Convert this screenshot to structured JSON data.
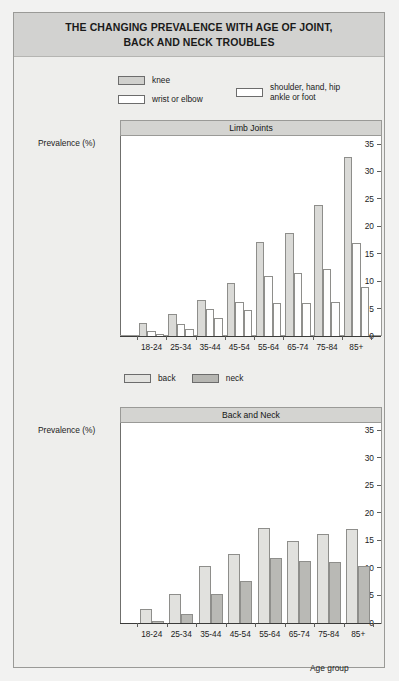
{
  "figure": {
    "title_line1": "THE CHANGING PREVALENCE WITH AGE OF JOINT,",
    "title_line2": "BACK AND NECK TROUBLES",
    "background_color": "#eeeeec",
    "title_band_color": "#d2d2d0",
    "border_color": "#9a9a97"
  },
  "legend1": {
    "items": [
      {
        "label": "knee",
        "swatch": "knee-swatch",
        "color": "#d0d0cd"
      },
      {
        "label": "wrist or elbow",
        "swatch": "wrist-or-elbow-swatch",
        "color": "#ffffff"
      },
      {
        "label_line1": "shoulder, hand, hip",
        "label_line2": "ankle or foot",
        "swatch": "shoulder-hand-hip-swatch",
        "color": "#ffffff"
      }
    ]
  },
  "legend2": {
    "items": [
      {
        "label": "back",
        "swatch": "back-swatch",
        "color": "#e3e3e0"
      },
      {
        "label": "neck",
        "swatch": "neck-swatch",
        "color": "#b6b6b2"
      }
    ]
  },
  "axis_titles": {
    "y1": "Prevalence (%)",
    "y2": "Prevalence (%)",
    "x2": "Age group"
  },
  "chart_data": [
    {
      "type": "bar",
      "title": "Limb Joints",
      "xlabel": "",
      "ylabel": "Prevalence (%)",
      "ylim": [
        0,
        35
      ],
      "yticks": [
        0,
        5,
        10,
        15,
        20,
        25,
        30,
        35
      ],
      "ytick_labels": [
        "0",
        "5",
        "10",
        "15",
        "20",
        "25",
        "30",
        "35"
      ],
      "grid": false,
      "legend_position": "above-left",
      "categories": [
        "18-24",
        "25-34",
        "35-44",
        "45-54",
        "55-64",
        "65-74",
        "75-84",
        "85+"
      ],
      "series": [
        {
          "name": "knee",
          "key": "knee",
          "color": "#dadad7",
          "values": [
            2.3,
            4.1,
            6.6,
            9.6,
            17.2,
            18.8,
            23.8,
            32.7
          ]
        },
        {
          "name": "wrist or elbow",
          "key": "wrist",
          "color": "#fdfdfd",
          "values": [
            1.0,
            2.2,
            4.9,
            6.2,
            11.0,
            11.5,
            12.3,
            17.0
          ]
        },
        {
          "name": "shoulder, hand, hip ankle or foot",
          "key": "shoul",
          "color": "#fdfdfd",
          "values": [
            0.4,
            1.2,
            3.3,
            4.7,
            6.0,
            6.0,
            6.2,
            9.0
          ]
        }
      ]
    },
    {
      "type": "bar",
      "title": "Back and Neck",
      "xlabel": "Age group",
      "ylabel": "Prevalence (%)",
      "ylim": [
        0,
        35
      ],
      "yticks": [
        0,
        5,
        10,
        15,
        20,
        25,
        30,
        35
      ],
      "ytick_labels": [
        "0",
        "5",
        "10",
        "15",
        "20",
        "25",
        "30",
        "35"
      ],
      "grid": false,
      "legend_position": "above-left",
      "categories": [
        "18-24",
        "25-34",
        "35-44",
        "45-54",
        "55-64",
        "65-74",
        "75-84",
        "85+"
      ],
      "series": [
        {
          "name": "back",
          "key": "back",
          "color": "#e1e1de",
          "values": [
            2.5,
            5.3,
            10.3,
            12.5,
            17.3,
            14.9,
            16.1,
            17.0
          ]
        },
        {
          "name": "neck",
          "key": "neck",
          "color": "#b9b9b5",
          "values": [
            0.4,
            1.6,
            5.2,
            7.6,
            11.8,
            11.2,
            11.0,
            10.4
          ]
        }
      ]
    }
  ]
}
